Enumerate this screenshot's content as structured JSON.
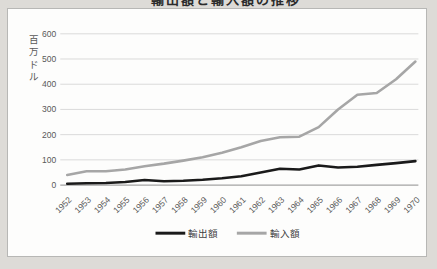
{
  "frame": {
    "outer_bg": "#dddbd7",
    "chart_bg": "#fdfdfc",
    "border_color": "#b7b7b5"
  },
  "clipped_title": {
    "text": "輸出額と輸入額の推移",
    "visibility": "bottom edge of glyphs only, cut off by top of screenshot"
  },
  "chart_data": {
    "type": "line",
    "categories": [
      "1952",
      "1953",
      "1954",
      "1955",
      "1956",
      "1957",
      "1958",
      "1959",
      "1960",
      "1961",
      "1962",
      "1963",
      "1964",
      "1965",
      "1966",
      "1967",
      "1968",
      "1969",
      "1970"
    ],
    "series": [
      {
        "key": "exports",
        "name": "輸出額",
        "color": "#1a1a1a",
        "values": [
          5,
          7,
          8,
          12,
          20,
          15,
          17,
          21,
          27,
          35,
          50,
          65,
          62,
          78,
          70,
          73,
          80,
          87,
          95
        ]
      },
      {
        "key": "imports",
        "name": "輸入額",
        "color": "#a6a6a6",
        "values": [
          40,
          55,
          55,
          62,
          75,
          85,
          97,
          110,
          128,
          150,
          175,
          190,
          192,
          230,
          300,
          358,
          365,
          420,
          490
        ]
      }
    ],
    "ylabel": "百万ドル",
    "ylabel_chars": [
      "百",
      "万",
      "ド",
      "ル"
    ],
    "yticks": [
      0,
      100,
      200,
      300,
      400,
      500,
      600
    ],
    "ylim": [
      0,
      600
    ],
    "grid": true,
    "legend_position": "bottom",
    "colors": {
      "axis_text": "#595959",
      "gridline": "#dadada",
      "axis_line": "#a3a3a3",
      "legend_text": "#404040"
    }
  }
}
